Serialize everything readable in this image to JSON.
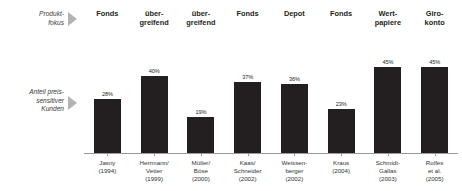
{
  "rows": {
    "product_focus_label": "Produkt-\nfokus",
    "price_sensitive_label": "Anteil preis-\nsensitiver\nKunden"
  },
  "colors": {
    "bar": "#231f20",
    "arrow": "#b3b3b3",
    "axis": "#9a9a9a",
    "label_text": "#3a3a3a"
  },
  "product_focus": [
    {
      "text": "Fonds"
    },
    {
      "text": "über-\ngreifend"
    },
    {
      "text": "über-\ngreifend"
    },
    {
      "text": "Fonds"
    },
    {
      "text": "Depot"
    },
    {
      "text": "Fonds"
    },
    {
      "text": "Wert-\npapiere"
    },
    {
      "text": "Giro-\nkonto"
    }
  ],
  "chart_data": {
    "type": "bar",
    "title": "",
    "xlabel": "",
    "ylabel": "Anteil preis-sensitiver Kunden",
    "ylim": [
      0,
      50
    ],
    "grid": false,
    "legend": "none",
    "categories": [
      "Jasny\n(1994)",
      "Herrmann/\nVetter\n(1999)",
      "Müller/\nBöse\n(2000)",
      "Kaas/\nSchneider\n(2002)",
      "Weissen-\nberger\n(2002)",
      "Kraus\n(2004)",
      "Schmidt-\nGallas\n(2003)",
      "Rolfes\net al.\n(2005)"
    ],
    "values": [
      28,
      40,
      19,
      37,
      36,
      23,
      45,
      45
    ],
    "value_labels": [
      "28%",
      "40%",
      "19%",
      "37%",
      "36%",
      "23%",
      "45%",
      "45%"
    ]
  }
}
